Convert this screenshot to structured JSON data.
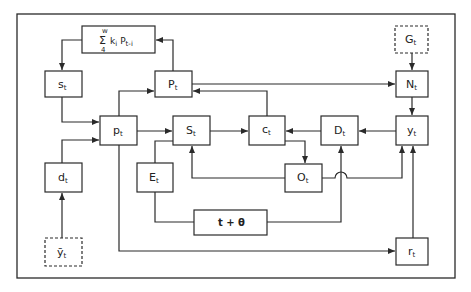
{
  "diagram": {
    "type": "block-diagram",
    "colors": {
      "stroke": "#2a2a2a",
      "background": "#ffffff",
      "text": "#222222"
    },
    "nodes": [
      {
        "id": "sum",
        "label": "Σ k_i P_{t-i}",
        "sum_upper": "w",
        "sum_lower": "4",
        "sum_symbol": "Σ",
        "main": "k",
        "main_sub": "i",
        "second": "P",
        "second_sub": "t-i",
        "style": "solid"
      },
      {
        "id": "s",
        "main": "s",
        "sub": "t",
        "style": "solid"
      },
      {
        "id": "P_upper",
        "main": "P",
        "sub": "t",
        "style": "solid"
      },
      {
        "id": "p",
        "main": "p",
        "sub": "t",
        "style": "solid"
      },
      {
        "id": "S",
        "main": "S",
        "sub": "t",
        "style": "solid"
      },
      {
        "id": "c",
        "main": "c",
        "sub": "t",
        "style": "solid"
      },
      {
        "id": "D",
        "main": "D",
        "sub": "t",
        "style": "solid"
      },
      {
        "id": "y",
        "main": "y",
        "sub": "t",
        "style": "solid"
      },
      {
        "id": "N",
        "main": "N",
        "sub": "t",
        "style": "solid"
      },
      {
        "id": "G",
        "main": "G",
        "sub": "t",
        "style": "dashed"
      },
      {
        "id": "d",
        "main": "d",
        "sub": "t",
        "style": "solid"
      },
      {
        "id": "E",
        "main": "E",
        "sub": "t",
        "style": "solid"
      },
      {
        "id": "O",
        "main": "O",
        "sub": "t",
        "style": "solid"
      },
      {
        "id": "delay",
        "main": "t + θ",
        "sub": "",
        "style": "solid"
      },
      {
        "id": "ybar",
        "main": "ȳ",
        "sub": "t",
        "style": "dashed"
      },
      {
        "id": "r",
        "main": "r",
        "sub": "t",
        "style": "solid"
      }
    ],
    "edges": [
      {
        "from": "P_upper",
        "to": "sum"
      },
      {
        "from": "sum",
        "to": "s"
      },
      {
        "from": "s",
        "to": "p"
      },
      {
        "from": "d",
        "to": "p"
      },
      {
        "from": "ybar",
        "to": "d"
      },
      {
        "from": "p",
        "to": "P_upper"
      },
      {
        "from": "p",
        "to": "S"
      },
      {
        "from": "p",
        "to": "r"
      },
      {
        "from": "P_upper",
        "to": "N"
      },
      {
        "from": "c",
        "to": "P_upper"
      },
      {
        "from": "S",
        "to": "c"
      },
      {
        "from": "E",
        "to": "S"
      },
      {
        "from": "O",
        "to": "S"
      },
      {
        "from": "c",
        "to": "O"
      },
      {
        "from": "D",
        "to": "c"
      },
      {
        "from": "y",
        "to": "D"
      },
      {
        "from": "E",
        "to": "delay"
      },
      {
        "from": "delay",
        "to": "D"
      },
      {
        "from": "O",
        "to": "y"
      },
      {
        "from": "r",
        "to": "y"
      },
      {
        "from": "G",
        "to": "N"
      },
      {
        "from": "N",
        "to": "y"
      }
    ]
  }
}
